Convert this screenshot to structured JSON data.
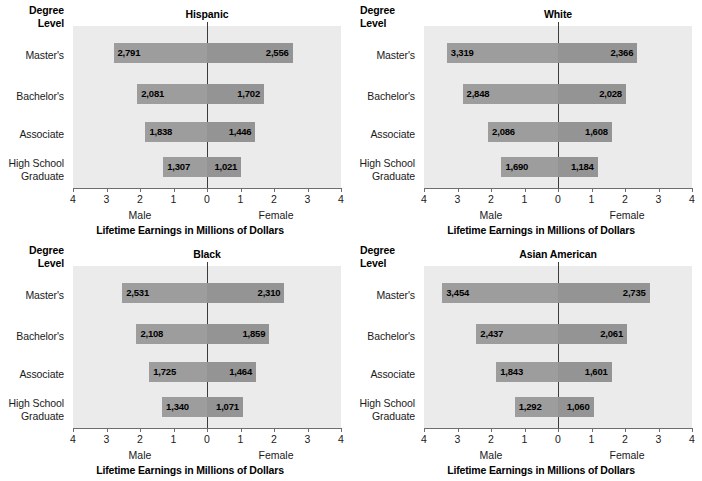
{
  "figure": {
    "degree_header_line1": "Degree",
    "degree_header_line2": "Level",
    "axis_title": "Lifetime Earnings in Millions of Dollars",
    "male_label": "Male",
    "female_label": "Female",
    "categories": [
      "Master's",
      "Bachelor's",
      "Associate",
      "High School Graduate"
    ],
    "category_lines": [
      {
        "l1": "Master's",
        "l2": ""
      },
      {
        "l1": "Bachelor's",
        "l2": ""
      },
      {
        "l1": "Associate",
        "l2": ""
      },
      {
        "l1": "High School",
        "l2": "Graduate"
      }
    ],
    "tick_labels": [
      "4",
      "3",
      "2",
      "1",
      "0",
      "1",
      "2",
      "3",
      "4"
    ],
    "colors": {
      "plot_background": "#ebebeb",
      "bar_male": "#9d9d9d",
      "bar_female": "#949494",
      "zero_line": "#3b3b3b",
      "axis": "#6e6e6e",
      "text": "#000000"
    }
  },
  "chart_data": [
    {
      "type": "bar",
      "title": "Hispanic",
      "xlabel": "Lifetime Earnings in Millions of Dollars",
      "ylabel": "Degree Level",
      "xlim": [
        -4,
        4
      ],
      "grid": false,
      "legend": "none",
      "orientation": "horizontal-diverging",
      "categories": [
        "Master's",
        "Bachelor's",
        "Associate",
        "High School Graduate"
      ],
      "series": [
        {
          "name": "Male",
          "side": "left",
          "values": [
            2.791,
            2.081,
            1.838,
            1.307
          ],
          "labels": [
            "2,791",
            "2,081",
            "1,838",
            "1,307"
          ]
        },
        {
          "name": "Female",
          "side": "right",
          "values": [
            2.556,
            1.702,
            1.446,
            1.021
          ],
          "labels": [
            "2,556",
            "1,702",
            "1,446",
            "1,021"
          ]
        }
      ]
    },
    {
      "type": "bar",
      "title": "White",
      "xlabel": "Lifetime Earnings in Millions of Dollars",
      "ylabel": "Degree Level",
      "xlim": [
        -4,
        4
      ],
      "grid": false,
      "legend": "none",
      "orientation": "horizontal-diverging",
      "categories": [
        "Master's",
        "Bachelor's",
        "Associate",
        "High School Graduate"
      ],
      "series": [
        {
          "name": "Male",
          "side": "left",
          "values": [
            3.319,
            2.848,
            2.086,
            1.69
          ],
          "labels": [
            "3,319",
            "2,848",
            "2,086",
            "1,690"
          ]
        },
        {
          "name": "Female",
          "side": "right",
          "values": [
            2.366,
            2.028,
            1.608,
            1.184
          ],
          "labels": [
            "2,366",
            "2,028",
            "1,608",
            "1,184"
          ]
        }
      ]
    },
    {
      "type": "bar",
      "title": "Black",
      "xlabel": "Lifetime Earnings in Millions of Dollars",
      "ylabel": "Degree Level",
      "xlim": [
        -4,
        4
      ],
      "grid": false,
      "legend": "none",
      "orientation": "horizontal-diverging",
      "categories": [
        "Master's",
        "Bachelor's",
        "Associate",
        "High School Graduate"
      ],
      "series": [
        {
          "name": "Male",
          "side": "left",
          "values": [
            2.531,
            2.108,
            1.725,
            1.34
          ],
          "labels": [
            "2,531",
            "2,108",
            "1,725",
            "1,340"
          ]
        },
        {
          "name": "Female",
          "side": "right",
          "values": [
            2.31,
            1.859,
            1.464,
            1.071
          ],
          "labels": [
            "2,310",
            "1,859",
            "1,464",
            "1,071"
          ]
        }
      ]
    },
    {
      "type": "bar",
      "title": "Asian American",
      "xlabel": "Lifetime Earnings in Millions of Dollars",
      "ylabel": "Degree Level",
      "xlim": [
        -4,
        4
      ],
      "grid": false,
      "legend": "none",
      "orientation": "horizontal-diverging",
      "categories": [
        "Master's",
        "Bachelor's",
        "Associate",
        "High School Graduate"
      ],
      "series": [
        {
          "name": "Male",
          "side": "left",
          "values": [
            3.454,
            2.437,
            1.843,
            1.292
          ],
          "labels": [
            "3,454",
            "2,437",
            "1,843",
            "1,292"
          ]
        },
        {
          "name": "Female",
          "side": "right",
          "values": [
            2.735,
            2.061,
            1.601,
            1.06
          ],
          "labels": [
            "2,735",
            "2,061",
            "1,601",
            "1,060"
          ]
        }
      ]
    }
  ]
}
